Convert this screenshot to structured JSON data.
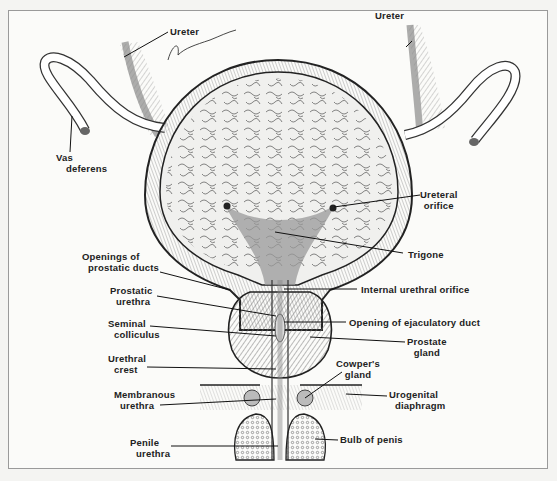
{
  "diagram": {
    "type": "anatomical illustration",
    "signature": "Peter Stone",
    "labels": {
      "ureter_left": "Ureter",
      "ureter_right": "Ureter",
      "vas_deferens_1": "Vas",
      "vas_deferens_2": "deferens",
      "ureteral_orifice_1": "Ureteral",
      "ureteral_orifice_2": "orifice",
      "trigone": "Trigone",
      "openings_prostatic_ducts_1": "Openings of",
      "openings_prostatic_ducts_2": "prostatic ducts",
      "internal_urethral_orifice": "Internal urethral orifice",
      "prostatic_urethra_1": "Prostatic",
      "prostatic_urethra_2": "urethra",
      "opening_ejaculatory_duct": "Opening of ejaculatory duct",
      "seminal_colliculus_1": "Seminal",
      "seminal_colliculus_2": "colliculus",
      "prostate_gland_1": "Prostate",
      "prostate_gland_2": "gland",
      "urethral_crest_1": "Urethral",
      "urethral_crest_2": "crest",
      "cowpers_gland_1": "Cowper's",
      "cowpers_gland_2": "gland",
      "membranous_urethra_1": "Membranous",
      "membranous_urethra_2": "urethra",
      "urogenital_diaphragm_1": "Urogenital",
      "urogenital_diaphragm_2": "diaphragm",
      "penile_urethra_1": "Penile",
      "penile_urethra_2": "urethra",
      "bulb_of_penis": "Bulb of penis"
    },
    "colors": {
      "background": "#fbfbf9",
      "ink": "#222222",
      "mucosa_gray": "#9a9a9a",
      "trigone_gray": "#8c8c8c",
      "wall_gray": "#bdbdbd"
    }
  }
}
